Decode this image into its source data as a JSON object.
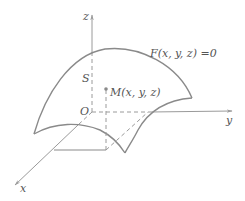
{
  "diagram": {
    "type": "3d-surface-coordinate-sketch",
    "colors": {
      "surface": "#8a8a8a",
      "axis": "#9a9a9a",
      "dashed": "#9a9a9a",
      "text": "#555555",
      "background": "#ffffff"
    },
    "axes": {
      "z_label": "z",
      "y_label": "y",
      "x_label": "x",
      "origin_label": "O"
    },
    "surface": {
      "label": "F(x, y, z) =0",
      "region_label": "S"
    },
    "point": {
      "label": "M(x, y, z)"
    }
  }
}
